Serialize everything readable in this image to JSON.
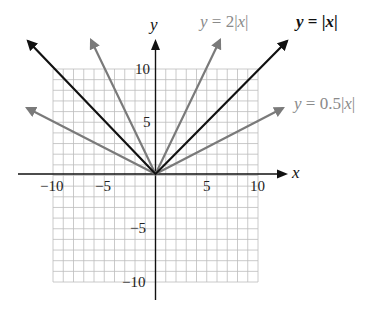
{
  "chart_data": {
    "type": "line",
    "title": "",
    "xlabel": "x",
    "ylabel": "y",
    "xlim": [
      -10,
      10
    ],
    "ylim": [
      -10,
      10
    ],
    "grid": true,
    "grid_step": 1,
    "x_ticks": [
      -10,
      -5,
      5,
      10
    ],
    "y_ticks": [
      10,
      5,
      -5,
      -10
    ],
    "x_tick_labels": [
      "−10",
      "−5",
      "5",
      "10"
    ],
    "y_tick_labels": [
      "10",
      "5",
      "−5",
      "−10"
    ],
    "legend_position": "inline labels at arrow ends (top right)",
    "series": [
      {
        "name": "y = 2|x|",
        "expression": "2*abs(x)",
        "color": "#7a7a7a",
        "x": [
          -6.2,
          0,
          6.2
        ],
        "y": [
          12.4,
          0,
          12.4
        ],
        "arrows": "both ends"
      },
      {
        "name": "y = |x|",
        "expression": "abs(x)",
        "color": "#111111",
        "x": [
          -12.4,
          0,
          12.4
        ],
        "y": [
          12.4,
          0,
          12.4
        ],
        "arrows": "both ends"
      },
      {
        "name": "y = 0.5|x|",
        "expression": "0.5*abs(x)",
        "color": "#7a7a7a",
        "x": [
          -12.5,
          0,
          12.5
        ],
        "y": [
          6.25,
          0,
          6.25
        ],
        "arrows": "both ends"
      }
    ]
  },
  "labels": {
    "x_axis": "x",
    "y_axis": "y",
    "fn_2abs": {
      "prefix": "y",
      "eq": " = 2|",
      "var": "x",
      "suffix": "|"
    },
    "fn_abs": {
      "prefix": "y",
      "eq": " = |",
      "var": "x",
      "suffix": "|"
    },
    "fn_half": {
      "prefix": "y",
      "eq": " = 0.5|",
      "var": "x",
      "suffix": "|"
    },
    "ticks": {
      "x_neg10": "−10",
      "x_neg5": "−5",
      "x_5": "5",
      "x_10": "10",
      "y_10": "10",
      "y_5": "5",
      "y_neg5": "−5",
      "y_neg10": "−10"
    }
  },
  "colors": {
    "grid": "#bdbdbd",
    "axis": "#111111",
    "black_line": "#111111",
    "gray_line": "#7a7a7a",
    "gray_label": "#8a8a8a"
  }
}
